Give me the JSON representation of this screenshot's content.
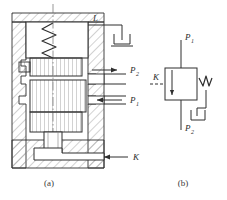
{
  "figure": {
    "title_a": "(a)",
    "title_b": "(b)",
    "labels": {
      "drain_l": "L",
      "port_p2": "P",
      "port_p2_sub": "2",
      "port_p1": "P",
      "port_p1_sub": "1",
      "control_k": "K",
      "sym_p1": "P",
      "sym_p1_sub": "1",
      "sym_p2": "P",
      "sym_p2_sub": "2",
      "sym_k": "K"
    },
    "colors": {
      "line": "#2f2f2f",
      "hatch": "#8e8e8e",
      "thin": "#5a5a5a",
      "background": "#ffffff",
      "text": "#2b2b2b"
    },
    "components": {
      "spring_chamber": "spring-chamber",
      "spring": "compression-spring",
      "spool": "valve-spool",
      "housing": "valve-housing",
      "drain_symbol": "tank-drain-symbol",
      "pilot_line": "pilot-control-line",
      "symbol_box": "valve-symbol-box",
      "flow_arrow_out": "p2-flow-arrow",
      "flow_arrow_in": "p1-flow-arrow",
      "control_arrow": "k-control-arrow"
    }
  }
}
